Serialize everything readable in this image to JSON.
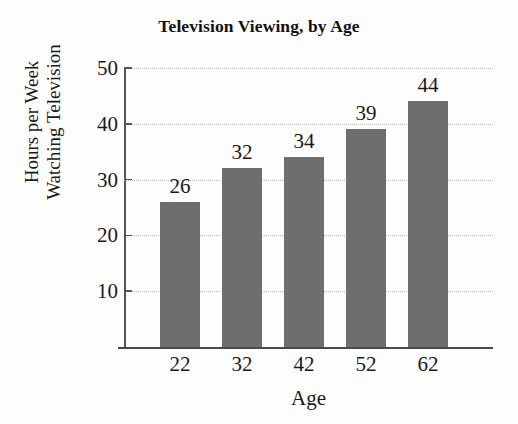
{
  "chart_data": {
    "type": "bar",
    "title": "Television Viewing, by Age",
    "xlabel": "Age",
    "ylabel_lines": [
      "Hours per Week",
      "Watching Television"
    ],
    "ylabel": "Hours per Week Watching Television",
    "categories": [
      "22",
      "32",
      "42",
      "52",
      "62"
    ],
    "values": [
      26,
      32,
      34,
      39,
      44
    ],
    "value_labels": [
      "26",
      "32",
      "34",
      "39",
      "44"
    ],
    "ylim": [
      0,
      50
    ],
    "yticks": [
      10,
      20,
      30,
      40,
      50
    ],
    "ytick_labels": [
      "10",
      "20",
      "30",
      "40",
      "50"
    ],
    "grid": true,
    "grid_style": "dotted",
    "legend": "none",
    "bar_color": "#6e6e6e",
    "background_color": "#fdfdfd",
    "axis_color": "#4a4a4a",
    "gridline_color": "#b9b9b9",
    "text_color": "#1a1a1a"
  }
}
